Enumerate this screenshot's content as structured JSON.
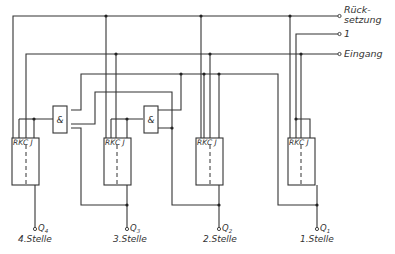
{
  "diagram": {
    "type": "circuit",
    "inputs": [
      {
        "id": "reset",
        "label_line1": "Rück-",
        "label_line2": "setzung"
      },
      {
        "id": "one",
        "label": "1"
      },
      {
        "id": "input",
        "label": "Eingang"
      }
    ],
    "and_gates": [
      {
        "id": "and1",
        "label": "&"
      },
      {
        "id": "and2",
        "label": "&"
      }
    ],
    "flip_flops": [
      {
        "id": "ff4",
        "pins": "RKC J",
        "output": "Q",
        "output_sub": "4",
        "stage": "4.Stelle"
      },
      {
        "id": "ff3",
        "pins": "RKC J",
        "output": "Q",
        "output_sub": "3",
        "stage": "3.Stelle"
      },
      {
        "id": "ff2",
        "pins": "RKC J",
        "output": "Q",
        "output_sub": "2",
        "stage": "2.Stelle"
      },
      {
        "id": "ff1",
        "pins": "RKC J",
        "output": "Q",
        "output_sub": "1",
        "stage": "1.Stelle"
      }
    ]
  }
}
